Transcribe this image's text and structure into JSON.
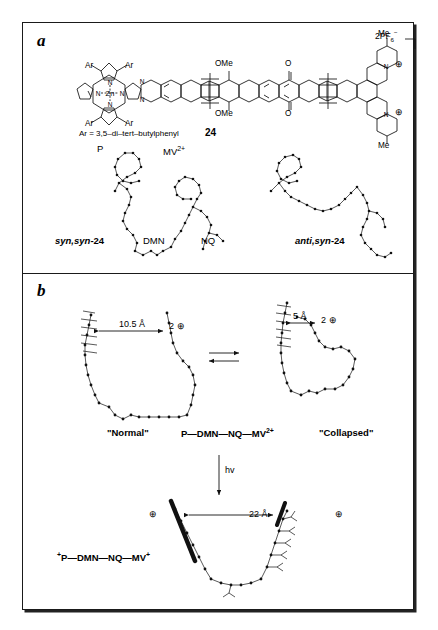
{
  "figure": {
    "panels": [
      {
        "id": "a",
        "label": "a"
      },
      {
        "id": "b",
        "label": "b"
      }
    ]
  },
  "panel_a": {
    "compound_number": "24",
    "ar_definition": "Ar = 3,5–di–tert–butylphenyl",
    "ar_label": "Ar",
    "metal_label": "Zn",
    "nitrogen_label": "N",
    "methoxy_label": "OMe",
    "oxygen_label": "O",
    "methyl_label": "Me",
    "counterion": "2PF6−",
    "counterion_text": "2PF",
    "counterion_sub": "6",
    "counterion_sup": "−",
    "charge_symbol": "⊕",
    "conformers": [
      {
        "name": "syn,syn-24",
        "italic_part": "syn,syn",
        "plain_part": "-24"
      },
      {
        "name": "anti,syn-24",
        "italic_part": "anti,syn",
        "plain_part": "-24"
      }
    ],
    "subunit_labels": [
      {
        "name": "P",
        "text": "P"
      },
      {
        "name": "MV2+",
        "text": "MV",
        "sup": "2+"
      },
      {
        "name": "DMN",
        "text": "DMN"
      },
      {
        "name": "NQ",
        "text": "NQ"
      }
    ]
  },
  "panel_b": {
    "state_normal": "\"Normal\"",
    "state_collapsed": "\"Collapsed\"",
    "ground_state_formula": "P—DMN—NQ—MV",
    "ground_state_sup": "2+",
    "excited_state_sup_pre": "+",
    "excited_state_formula": "P—DMN—NQ—MV",
    "excited_state_sup_post": "+",
    "distance_normal": "10.5 Å",
    "distance_collapsed": "5 Å",
    "distance_separated": "22 Å",
    "charge_normal": "2",
    "charge_collapsed": "2",
    "charge_symbol": "⊕",
    "photon_label": "hv",
    "equilibrium_symbol": "⇌"
  },
  "colors": {
    "ink": "#111111",
    "frame": "#1a1a1a",
    "background": "#ffffff"
  }
}
